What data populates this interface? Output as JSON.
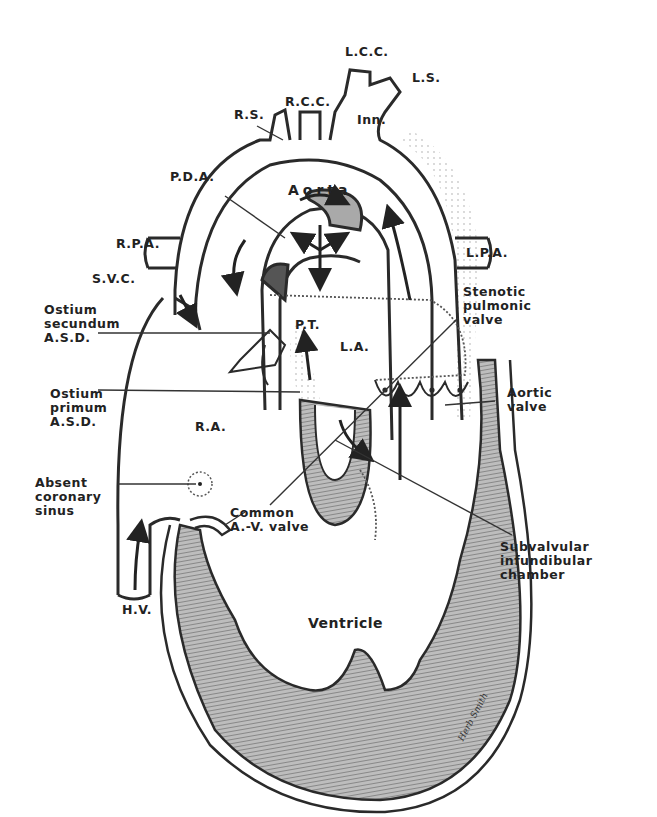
{
  "diagram": {
    "labels": {
      "lcc": "L.C.C.",
      "ls": "L.S.",
      "rs": "R.S.",
      "rcc": "R.C.C.",
      "inn": "Inn.",
      "pda": "P.D.A.",
      "aorta": "Aorta",
      "rpa": "R.P.A.",
      "lpa": "L.P.A.",
      "svc": "S.V.C.",
      "ostium_secundum": "Ostium\nsecundum\nA.S.D.",
      "stenotic_pulmonic_valve": "Stenotic\npulmonic\nvalve",
      "pt": "P.T.",
      "la": "L.A.",
      "ostium_primum": "Ostium\nprimum\nA.S.D.",
      "aortic_valve": "Aortic\nvalve",
      "ra": "R.A.",
      "absent_coronary_sinus": "Absent\ncoronary\nsinus",
      "common_av_valve": "Common\nA.-V. valve",
      "subvalvular": "Subvalvular\ninfundibular\nchamber",
      "hv": "H.V.",
      "ventricle": "Ventricle",
      "signature": "Herb Smith"
    },
    "colors": {
      "line": "#2a2a2a",
      "muscle": "#8a8a8a",
      "background": "#ffffff"
    }
  }
}
